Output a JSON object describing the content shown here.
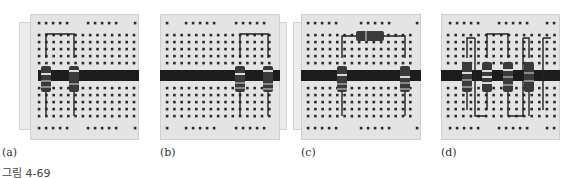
{
  "figure": {
    "caption": "그림 4-69",
    "panels": [
      {
        "id": "a",
        "label": "(a)",
        "description": "Two resistors on breadboard joined at top by a jumper; dark bus strip across middle"
      },
      {
        "id": "b",
        "label": "(b)",
        "description": "Two resistors on right side joined at top by a jumper"
      },
      {
        "id": "c",
        "label": "(c)",
        "description": "Horizontal resistor at top connecting two vertical resistors"
      },
      {
        "id": "d",
        "label": "(d)",
        "description": "Four resistors with interleaved jumper wires"
      }
    ]
  },
  "colors": {
    "board": "#e4e4e4",
    "hole": "#2a2a2a",
    "strip": "#1c1c1c",
    "wire": "#222222",
    "resistor_body": "#3a3a3a",
    "band_light": "#d8d8d8",
    "band_mid": "#8a8a8a"
  }
}
